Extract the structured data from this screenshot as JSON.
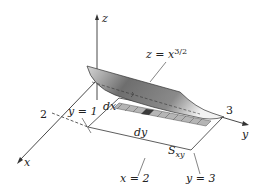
{
  "diagram": {
    "axes": {
      "x_label": "x",
      "y_label": "y",
      "z_label": "z",
      "x_tick": "2",
      "y_tick": "3"
    },
    "surface_label": "z = x",
    "surface_exponent": "3/2",
    "labels": {
      "dx": "dx",
      "dy": "dy",
      "y_eq_1": "y = 1",
      "x_eq_2": "x = 2",
      "y_eq_3": "y = 3",
      "region": "S",
      "region_sub": "xy"
    },
    "colors": {
      "strip_light": "#b5b5b5",
      "strip_dark": "#3a3a3a",
      "surface_dark": "#555555",
      "surface_light": "#eeeeee",
      "line": "#333333"
    }
  }
}
